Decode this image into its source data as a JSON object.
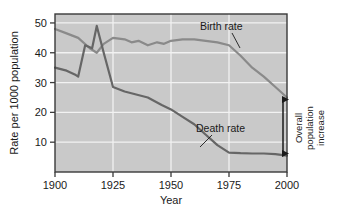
{
  "chart_data": {
    "type": "line",
    "title": "",
    "xlabel": "Year",
    "ylabel": "Rate per 1000 population",
    "xlim": [
      1900,
      2000
    ],
    "ylim": [
      0,
      53
    ],
    "xticks": [
      1900,
      1925,
      1950,
      1975,
      2000
    ],
    "yticks": [
      10,
      20,
      30,
      40,
      50
    ],
    "grid": true,
    "legend_position": "inline-labels",
    "series": [
      {
        "name": "Birth rate",
        "color": "#8a8a8a",
        "x": [
          1900,
          1905,
          1910,
          1915,
          1918,
          1921,
          1925,
          1930,
          1933,
          1936,
          1940,
          1944,
          1947,
          1950,
          1955,
          1960,
          1965,
          1970,
          1975,
          1980,
          1985,
          1990,
          1995,
          2000
        ],
        "y": [
          48,
          46.5,
          45,
          41.5,
          40,
          43,
          45,
          44.5,
          43.5,
          44,
          42.5,
          43.5,
          43,
          44,
          44.5,
          44.5,
          44,
          43.5,
          42.5,
          39,
          35,
          32,
          28.5,
          25
        ]
      },
      {
        "name": "Death rate",
        "color": "#666666",
        "x": [
          1900,
          1905,
          1909,
          1910,
          1913,
          1916,
          1918,
          1921,
          1925,
          1930,
          1935,
          1940,
          1946,
          1950,
          1955,
          1960,
          1965,
          1970,
          1975,
          1980,
          1985,
          1990,
          1995,
          2000
        ],
        "y": [
          35,
          34,
          32.5,
          32,
          42.5,
          41.5,
          49,
          40,
          28.5,
          27,
          26,
          25,
          22.5,
          21,
          18.5,
          16,
          12.5,
          9,
          6.5,
          6.3,
          6.2,
          6.2,
          6,
          5.5
        ]
      }
    ],
    "annotations": [
      {
        "name": "Overall population increase",
        "text_lines": [
          "Overall",
          "population",
          "increase"
        ],
        "type": "double-headed-arrow",
        "at_x": 2000,
        "from_y": 5.5,
        "to_y": 25
      }
    ]
  },
  "axis": {
    "y_title": "Rate per 1000 population",
    "x_title": "Year",
    "y_ticks": [
      "50",
      "40",
      "30",
      "20",
      "10"
    ],
    "x_ticks": [
      "1900",
      "1925",
      "1950",
      "1975",
      "2000"
    ]
  },
  "series_labels": {
    "birth": "Birth rate",
    "death": "Death rate"
  },
  "annotation": {
    "line1": "Overall",
    "line2": "population",
    "line3": "increase"
  },
  "colors": {
    "plot_background": "#c9c9c9",
    "gridline": "#f2f2f2",
    "plot_border": "#3a3a3a",
    "birth_line": "#8a8a8a",
    "death_line": "#666666",
    "text": "#1a1a1a",
    "page_background": "#ffffff"
  }
}
